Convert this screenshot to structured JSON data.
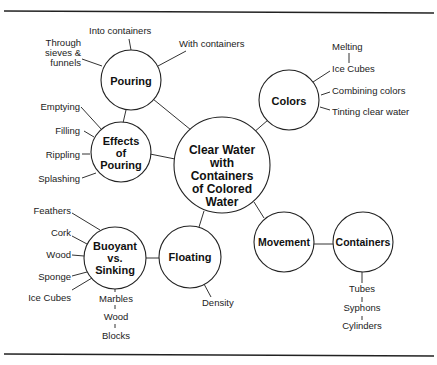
{
  "diagram": {
    "type": "concept-web",
    "center": {
      "lines": [
        "Clear Water",
        "with",
        "Containers",
        "of Colored",
        "Water"
      ]
    },
    "nodes": {
      "pouring": {
        "label_lines": [
          "Pouring"
        ],
        "leaves": [
          "Into containers",
          "With containers",
          "Through",
          "sieves &",
          "funnels"
        ]
      },
      "effects": {
        "label_lines": [
          "Effects",
          "of",
          "Pouring"
        ],
        "leaves": [
          "Emptying",
          "Filling",
          "Rippling",
          "Splashing"
        ]
      },
      "colors": {
        "label_lines": [
          "Colors"
        ],
        "leaves": [
          "Melting",
          "Ice Cubes",
          "Combining colors",
          "Tinting clear water"
        ]
      },
      "buoyant": {
        "label_lines": [
          "Buoyant",
          "vs.",
          "Sinking"
        ],
        "leaves": [
          "Feathers",
          "Cork",
          "Wood",
          "Sponge",
          "Ice Cubes",
          "Marbles",
          "Wood",
          "Blocks"
        ]
      },
      "floating": {
        "label_lines": [
          "Floating"
        ],
        "leaves": [
          "Density"
        ]
      },
      "movement": {
        "label_lines": [
          "Movement"
        ],
        "leaves": []
      },
      "containers": {
        "label_lines": [
          "Containers"
        ],
        "leaves": [
          "Tubes",
          "Syphons",
          "Cylinders"
        ]
      }
    }
  }
}
